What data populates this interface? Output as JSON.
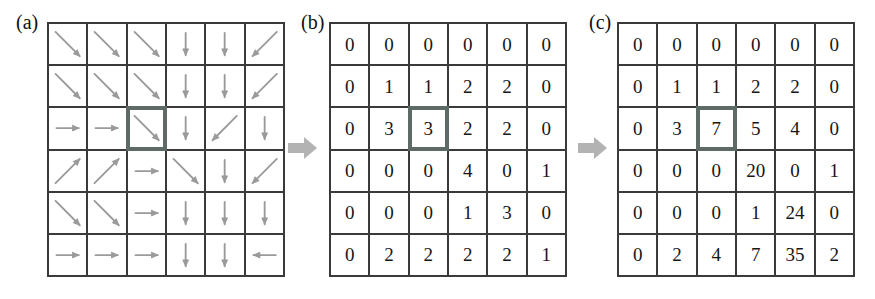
{
  "figure": {
    "caption_labels": [
      "(a)",
      "(b)",
      "(c)"
    ],
    "transition_icon": "right-block-arrow",
    "colors": {
      "grid_line": "#3a3a3a",
      "arrow_glyph": "#9a9a9a",
      "highlight_border": "#5d6a65",
      "transition_arrow": "#b3b3b3",
      "background": "#ffffff",
      "text": "#161616"
    }
  },
  "panels": [
    {
      "label": "(a)",
      "kind": "direction-field",
      "rows": 6,
      "cols": 6,
      "highlight": {
        "row": 2,
        "col": 2
      },
      "directions": [
        [
          "down-right",
          "down-right",
          "down-right",
          "down",
          "down",
          "down-left"
        ],
        [
          "down-right",
          "down-right",
          "down-right",
          "down",
          "down",
          "down-left"
        ],
        [
          "right",
          "right",
          "down-right",
          "down",
          "down-left",
          "down"
        ],
        [
          "up-right",
          "up-right",
          "right",
          "down-right",
          "down",
          "down-left"
        ],
        [
          "down-right",
          "down-right",
          "right",
          "down",
          "down",
          "down"
        ],
        [
          "right",
          "right",
          "right",
          "down",
          "down",
          "left"
        ]
      ]
    },
    {
      "label": "(b)",
      "kind": "value-grid",
      "rows": 6,
      "cols": 6,
      "highlight": {
        "row": 2,
        "col": 2
      },
      "values": [
        [
          "0",
          "0",
          "0",
          "0",
          "0",
          "0"
        ],
        [
          "0",
          "1",
          "1",
          "2",
          "2",
          "0"
        ],
        [
          "0",
          "3",
          "3",
          "2",
          "2",
          "0"
        ],
        [
          "0",
          "0",
          "0",
          "4",
          "0",
          "1"
        ],
        [
          "0",
          "0",
          "0",
          "1",
          "3",
          "0"
        ],
        [
          "0",
          "2",
          "2",
          "2",
          "2",
          "1"
        ]
      ]
    },
    {
      "label": "(c)",
      "kind": "value-grid",
      "rows": 6,
      "cols": 6,
      "highlight": {
        "row": 2,
        "col": 2
      },
      "values": [
        [
          "0",
          "0",
          "0",
          "0",
          "0",
          "0"
        ],
        [
          "0",
          "1",
          "1",
          "2",
          "2",
          "0"
        ],
        [
          "0",
          "3",
          "7",
          "5",
          "4",
          "0"
        ],
        [
          "0",
          "0",
          "0",
          "20",
          "0",
          "1"
        ],
        [
          "0",
          "0",
          "0",
          "1",
          "24",
          "0"
        ],
        [
          "0",
          "2",
          "4",
          "7",
          "35",
          "2"
        ]
      ]
    }
  ]
}
